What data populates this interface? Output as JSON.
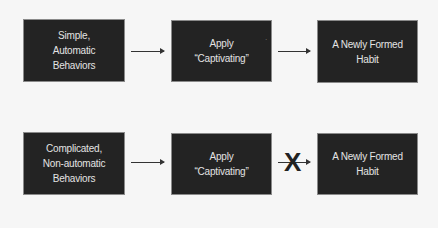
{
  "rows": [
    {
      "boxes": [
        {
          "text": "Simple,\nAutomatic\nBehaviors"
        },
        {
          "text": "Apply\n“Captivating”"
        },
        {
          "text": "A Newly Formed\nHabit"
        }
      ],
      "connector_to_habit": "arrow"
    },
    {
      "boxes": [
        {
          "text": "Complicated,\nNon-automatic\nBehaviors"
        },
        {
          "text": "Apply\n“Captivating”"
        },
        {
          "text": "A Newly Formed\nHabit"
        }
      ],
      "connector_to_habit": "blocked-arrow",
      "block_mark": "X"
    }
  ],
  "colors": {
    "background": "#f6f6f6",
    "box_fill": "#232323",
    "box_border": "#8a8a8a",
    "box_text": "#e4e4e4",
    "arrow": "#333333"
  },
  "stray_mark": "·"
}
